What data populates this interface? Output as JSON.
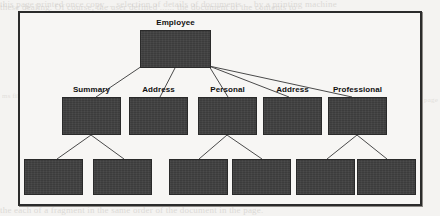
{
  "figure": {
    "kind": "hierarchy-tree-diagram",
    "frame_border_color": "#2b2b2b",
    "node_fill_color": "#3c3c3c",
    "connector_color": "#4a4a4a",
    "label_color": "#111111",
    "background_color": "#f7f6f4",
    "page_background_color": "#f4f3f1"
  },
  "scan_artifacts": {
    "top_line_1": "this page printed once copy ... selection of details of documents ... by a printing machine",
    "top_line_2": "these dealing. Of course, the user defined ...... the document of the contents to",
    "bottom_line": "the each of a fragment in the same order of the document in the page.",
    "left_margin": "ms file",
    "right_margin": "page"
  },
  "tree": {
    "root": {
      "id": "employee",
      "label": "Employee",
      "box": {
        "x": 140,
        "y": 30,
        "w": 71,
        "h": 38
      },
      "label_pos": {
        "x": 140,
        "y": 18,
        "w": 71
      }
    },
    "level2": [
      {
        "id": "summary",
        "label": "Summary",
        "box": {
          "x": 62,
          "y": 97,
          "w": 59,
          "h": 38
        },
        "label_pos": {
          "x": 62,
          "y": 85,
          "w": 59
        }
      },
      {
        "id": "address-1",
        "label": "Address",
        "box": {
          "x": 129,
          "y": 97,
          "w": 59,
          "h": 38
        },
        "label_pos": {
          "x": 129,
          "y": 85,
          "w": 59
        }
      },
      {
        "id": "personal",
        "label": "Personal",
        "box": {
          "x": 198,
          "y": 97,
          "w": 59,
          "h": 38
        },
        "label_pos": {
          "x": 198,
          "y": 85,
          "w": 59
        }
      },
      {
        "id": "address-2",
        "label": "Address",
        "box": {
          "x": 263,
          "y": 97,
          "w": 59,
          "h": 38
        },
        "label_pos": {
          "x": 263,
          "y": 85,
          "w": 59
        }
      },
      {
        "id": "professional",
        "label": "Professional",
        "box": {
          "x": 328,
          "y": 97,
          "w": 59,
          "h": 38
        },
        "label_pos": {
          "x": 322,
          "y": 85,
          "w": 71
        }
      }
    ],
    "level3": [
      {
        "id": "leaf-1",
        "label": "",
        "parent": "summary",
        "box": {
          "x": 24,
          "y": 159,
          "w": 59,
          "h": 36
        }
      },
      {
        "id": "leaf-2",
        "label": "",
        "parent": "summary",
        "box": {
          "x": 93,
          "y": 159,
          "w": 59,
          "h": 36
        }
      },
      {
        "id": "leaf-3",
        "label": "",
        "parent": "personal",
        "box": {
          "x": 169,
          "y": 159,
          "w": 59,
          "h": 36
        }
      },
      {
        "id": "leaf-4",
        "label": "",
        "parent": "personal",
        "box": {
          "x": 232,
          "y": 159,
          "w": 59,
          "h": 36
        }
      },
      {
        "id": "leaf-5",
        "label": "",
        "parent": "professional",
        "box": {
          "x": 296,
          "y": 159,
          "w": 59,
          "h": 36
        }
      },
      {
        "id": "leaf-6",
        "label": "",
        "parent": "professional",
        "box": {
          "x": 357,
          "y": 159,
          "w": 59,
          "h": 36
        }
      }
    ],
    "edges": [
      {
        "from": "employee",
        "to": "summary",
        "x1": 142,
        "y1": 66,
        "x2": 96,
        "y2": 97
      },
      {
        "from": "employee",
        "to": "address-1",
        "x1": 175,
        "y1": 68,
        "x2": 160,
        "y2": 97
      },
      {
        "from": "employee",
        "to": "personal",
        "x1": 209,
        "y1": 66,
        "x2": 228,
        "y2": 97
      },
      {
        "from": "employee",
        "to": "address-2",
        "x1": 209,
        "y1": 66,
        "x2": 289,
        "y2": 97
      },
      {
        "from": "employee",
        "to": "professional",
        "x1": 209,
        "y1": 66,
        "x2": 352,
        "y2": 97
      },
      {
        "from": "summary",
        "to": "leaf-1",
        "x1": 91,
        "y1": 135,
        "x2": 57,
        "y2": 159
      },
      {
        "from": "summary",
        "to": "leaf-2",
        "x1": 91,
        "y1": 135,
        "x2": 124,
        "y2": 159
      },
      {
        "from": "personal",
        "to": "leaf-3",
        "x1": 227,
        "y1": 135,
        "x2": 199,
        "y2": 159
      },
      {
        "from": "personal",
        "to": "leaf-4",
        "x1": 227,
        "y1": 135,
        "x2": 262,
        "y2": 159
      },
      {
        "from": "professional",
        "to": "leaf-5",
        "x1": 357,
        "y1": 135,
        "x2": 327,
        "y2": 159
      },
      {
        "from": "professional",
        "to": "leaf-6",
        "x1": 357,
        "y1": 135,
        "x2": 387,
        "y2": 159
      }
    ]
  }
}
